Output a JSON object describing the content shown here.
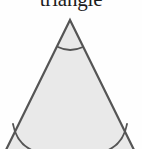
{
  "figure": {
    "caption": "triangle",
    "shape_name": "equilateral-triangle",
    "colors": {
      "background": "#fefefe",
      "fill": "#e9e9e9",
      "stroke": "#555555",
      "text": "#1c1c1c"
    },
    "geometry": {
      "apex": {
        "x": 70,
        "y": 20
      },
      "bottom_left": {
        "x": 3,
        "y": 156
      },
      "bottom_right": {
        "x": 137,
        "y": 156
      },
      "stroke_width": 2.2
    },
    "angle_marks": [
      {
        "name": "apex-angle-arc",
        "vertex": "apex",
        "path": "M 58 47 Q 70 53 83 47"
      },
      {
        "name": "bottom-left-angle-arc",
        "vertex": "bottom-left",
        "path": "M 13 124 Q 17 146 37 152"
      },
      {
        "name": "bottom-right-angle-arc",
        "vertex": "bottom-right",
        "path": "M 127 124 Q 123 146 103 152"
      }
    ]
  }
}
